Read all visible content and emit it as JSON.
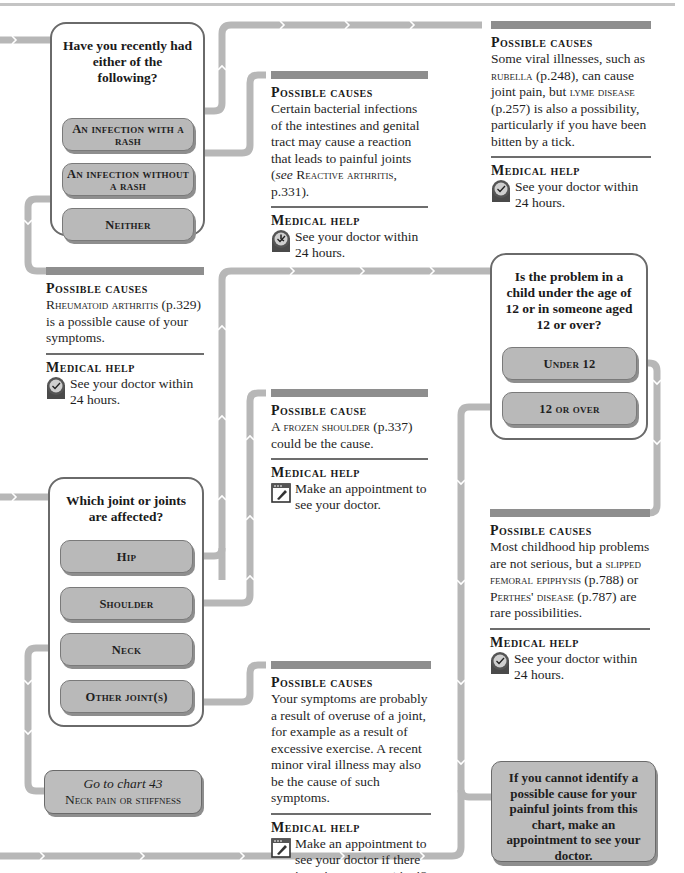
{
  "chart": {
    "accent_colors": {
      "path": "#b7b7b7",
      "box_border": "#6a6a6a",
      "option_fill": "#b9b9b9",
      "bar": "#8e8e8e"
    }
  },
  "q1": {
    "title": "Have you recently had either of the following?",
    "options": [
      {
        "label": "An infection with a rash"
      },
      {
        "label": "An infection without a rash"
      },
      {
        "label": "Neither"
      }
    ]
  },
  "info_reactive": {
    "heading": "Possible causes",
    "text_a": "Certain bacterial infections of the intestines and genital tract may cause a reaction that leads to painful joints (",
    "text_see": "see ",
    "text_link": "Reactive arthritis",
    "text_b": ", p.331).",
    "help_heading": "Medical help",
    "help_icon": "clock-icon",
    "help_text": "See your doctor within 24 hours."
  },
  "info_viral": {
    "heading": "Possible causes",
    "text_a": "Some viral illnesses, such as ",
    "link1": "rubella",
    "text_b": " (p.248), can cause joint pain, but ",
    "link2": "lyme disease",
    "text_c": " (p.257) is also a possibility, particularly if you have been bitten by a tick.",
    "help_heading": "Medical help",
    "help_icon": "clock-icon",
    "help_text": "See your doctor within 24 hours."
  },
  "info_ra": {
    "heading": "Possible causes",
    "link": "Rheumatoid arthritis",
    "text": " (p.329) is a possible cause of your symptoms.",
    "help_heading": "Medical help",
    "help_icon": "clock-icon",
    "help_text": "See your doctor within 24 hours."
  },
  "q2": {
    "title": "Is the problem in a child under the age of 12 or in someone aged 12 or over?",
    "options": [
      {
        "label": "Under 12"
      },
      {
        "label": "12 or over"
      }
    ]
  },
  "info_frozen": {
    "heading": "Possible cause",
    "link": "A frozen shoulder",
    "text": " (p.337) could be the cause.",
    "help_heading": "Medical help",
    "help_icon": "appointment-book-icon",
    "help_text": "Make an appointment to see your doctor."
  },
  "q3": {
    "title": "Which joint or joints are affected?",
    "options": [
      {
        "label": "Hip"
      },
      {
        "label": "Shoulder"
      },
      {
        "label": "Neck"
      },
      {
        "label": "Other joint(s)"
      }
    ]
  },
  "info_child_hip": {
    "heading": "Possible causes",
    "text_a": "Most childhood hip problems are not serious, but a ",
    "link1": "slipped femoral epiphysis",
    "text_b": " (p.788) or ",
    "link2": "Perthes' disease",
    "text_c": " (p.787) are rare possibilities.",
    "help_heading": "Medical help",
    "help_icon": "clock-icon",
    "help_text": "See your doctor within 24 hours."
  },
  "info_overuse": {
    "heading": "Possible causes",
    "text": "Your symptoms are probably a result of overuse of a joint, for example as a result of excessive exercise. A recent minor viral illness may also be the cause of such symptoms.",
    "help_heading": "Medical help",
    "help_icon": "appointment-book-icon",
    "help_text": "Make an appointment to see your doctor if there is no improvement in 48 hours."
  },
  "goto": {
    "line1": "Go to chart 43",
    "line2": "Neck pain or stiffness"
  },
  "final": {
    "text": "If you cannot identify a possible cause for your painful joints from this chart, make an appointment to see your doctor."
  }
}
